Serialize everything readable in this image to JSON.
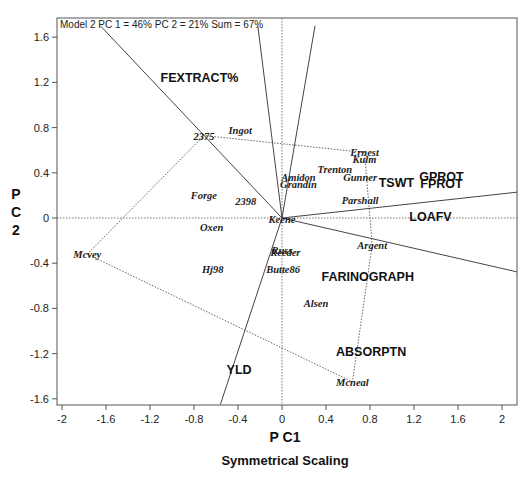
{
  "chart_data": {
    "type": "scatter",
    "subtype": "GGE biplot",
    "title": "",
    "annotation": "Model 2 PC 1 = 46% PC 2 = 21% Sum = 67%",
    "xlabel": "P C1",
    "ylabel": "P C 2",
    "subtitle": "Symmetrical Scaling",
    "xlim": [
      -2.0,
      2.15
    ],
    "ylim": [
      -1.65,
      1.75
    ],
    "xticks": [
      -2,
      -1.6,
      -1.2,
      -0.8,
      -0.4,
      0,
      0.4,
      0.8,
      1.2,
      1.6,
      2
    ],
    "xtick_labels": [
      "-2",
      "-1.6",
      "-1.2",
      "-0.8",
      "-0.4",
      "0",
      "0.4",
      "0.8",
      "1.2",
      "1.6",
      "2"
    ],
    "yticks": [
      1.6,
      1.2,
      0.8,
      0.4,
      0,
      -0.4,
      -0.8,
      -1.2,
      -1.6
    ],
    "ytick_labels": [
      "1.6",
      "1.2",
      "0.8",
      "0.4",
      "0",
      "-0.4",
      "-0.8",
      "-1.2",
      "-1.6"
    ],
    "grid": false,
    "reference_lines": {
      "x0_dotted": true,
      "y0_dotted": true
    },
    "genotypes": [
      {
        "name": "2375",
        "x": -0.71,
        "y": 0.73
      },
      {
        "name": "Ingot",
        "x": -0.38,
        "y": 0.78
      },
      {
        "name": "Ernest",
        "x": 0.75,
        "y": 0.58
      },
      {
        "name": "Kulm",
        "x": 0.75,
        "y": 0.52
      },
      {
        "name": "Trenton",
        "x": 0.48,
        "y": 0.43
      },
      {
        "name": "Gunner",
        "x": 0.71,
        "y": 0.36
      },
      {
        "name": "Amidon",
        "x": 0.15,
        "y": 0.36
      },
      {
        "name": "Grandin",
        "x": 0.15,
        "y": 0.3
      },
      {
        "name": "Parshall",
        "x": 0.71,
        "y": 0.16
      },
      {
        "name": "Forge",
        "x": -0.71,
        "y": 0.2
      },
      {
        "name": "2398",
        "x": -0.33,
        "y": 0.15
      },
      {
        "name": "Keene",
        "x": 0.0,
        "y": -0.01
      },
      {
        "name": "Oxen",
        "x": -0.64,
        "y": -0.08
      },
      {
        "name": "Mcvey",
        "x": -1.77,
        "y": -0.32
      },
      {
        "name": "Russ",
        "x": 0.0,
        "y": -0.28
      },
      {
        "name": "Reeder",
        "x": 0.03,
        "y": -0.3
      },
      {
        "name": "Hj98",
        "x": -0.63,
        "y": -0.45
      },
      {
        "name": "Butte86",
        "x": 0.01,
        "y": -0.45
      },
      {
        "name": "Argent",
        "x": 0.82,
        "y": -0.24
      },
      {
        "name": "Alsen",
        "x": 0.31,
        "y": -0.75
      },
      {
        "name": "Mcneal",
        "x": 0.64,
        "y": -1.45
      }
    ],
    "traits": [
      {
        "name": "FEXTRACT%",
        "x": -0.75,
        "y": 1.25
      },
      {
        "name": "GPROT",
        "x": 1.45,
        "y": 0.37
      },
      {
        "name": "FPROT",
        "x": 1.45,
        "y": 0.31
      },
      {
        "name": "TSWT",
        "x": 1.04,
        "y": 0.32
      },
      {
        "name": "LOAFV",
        "x": 1.35,
        "y": 0.02
      },
      {
        "name": "FARINOGRAPH",
        "x": 0.78,
        "y": -0.51
      },
      {
        "name": "ABSORPTN",
        "x": 0.81,
        "y": -1.18
      },
      {
        "name": "YLD",
        "x": -0.39,
        "y": -1.34
      }
    ],
    "polygon_vertices": [
      "Mcvey",
      "2375",
      "Ernest",
      "Argent",
      "Mcneal"
    ],
    "sector_rays": [
      {
        "to": [
          -1.65,
          1.7
        ]
      },
      {
        "to": [
          -0.22,
          1.7
        ]
      },
      {
        "to": [
          0.3,
          1.7
        ]
      },
      {
        "to": [
          2.15,
          0.23
        ]
      },
      {
        "to": [
          2.15,
          -0.48
        ]
      },
      {
        "to": [
          -0.56,
          -1.65
        ]
      }
    ]
  },
  "labels": {
    "annotation": "Model 2 PC 1 = 46% PC 2 = 21% Sum = 67%",
    "xlabel": "P C1",
    "ylabel_p": "P",
    "ylabel_c": "C",
    "ylabel_2": "2",
    "subtitle": "Symmetrical Scaling"
  }
}
